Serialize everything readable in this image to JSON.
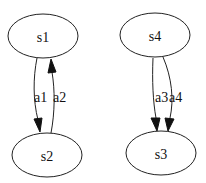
{
  "diagram": {
    "type": "directed-graph",
    "background": "#ffffff",
    "stroke_color": "#222222",
    "nodes": [
      {
        "id": "s1",
        "label": "s1",
        "shape": "ellipse",
        "cx": 43,
        "cy": 36,
        "rx": 35,
        "ry": 22
      },
      {
        "id": "s2",
        "label": "s2",
        "shape": "ellipse",
        "cx": 47,
        "cy": 155,
        "rx": 35,
        "ry": 22
      },
      {
        "id": "s4",
        "label": "s4",
        "shape": "ellipse",
        "cx": 155,
        "cy": 35,
        "rx": 35,
        "ry": 22
      },
      {
        "id": "s3",
        "label": "s3",
        "shape": "ellipse",
        "cx": 161,
        "cy": 153,
        "rx": 35,
        "ry": 22
      }
    ],
    "edges": [
      {
        "id": "e1",
        "from": "s1",
        "to": "s2",
        "label": "a1"
      },
      {
        "id": "e2",
        "from": "s2",
        "to": "s1",
        "label": "a2"
      },
      {
        "id": "e3",
        "from": "s4",
        "to": "s3",
        "label": "a3"
      },
      {
        "id": "e4",
        "from": "s4",
        "to": "s3",
        "label": "a4"
      }
    ]
  }
}
